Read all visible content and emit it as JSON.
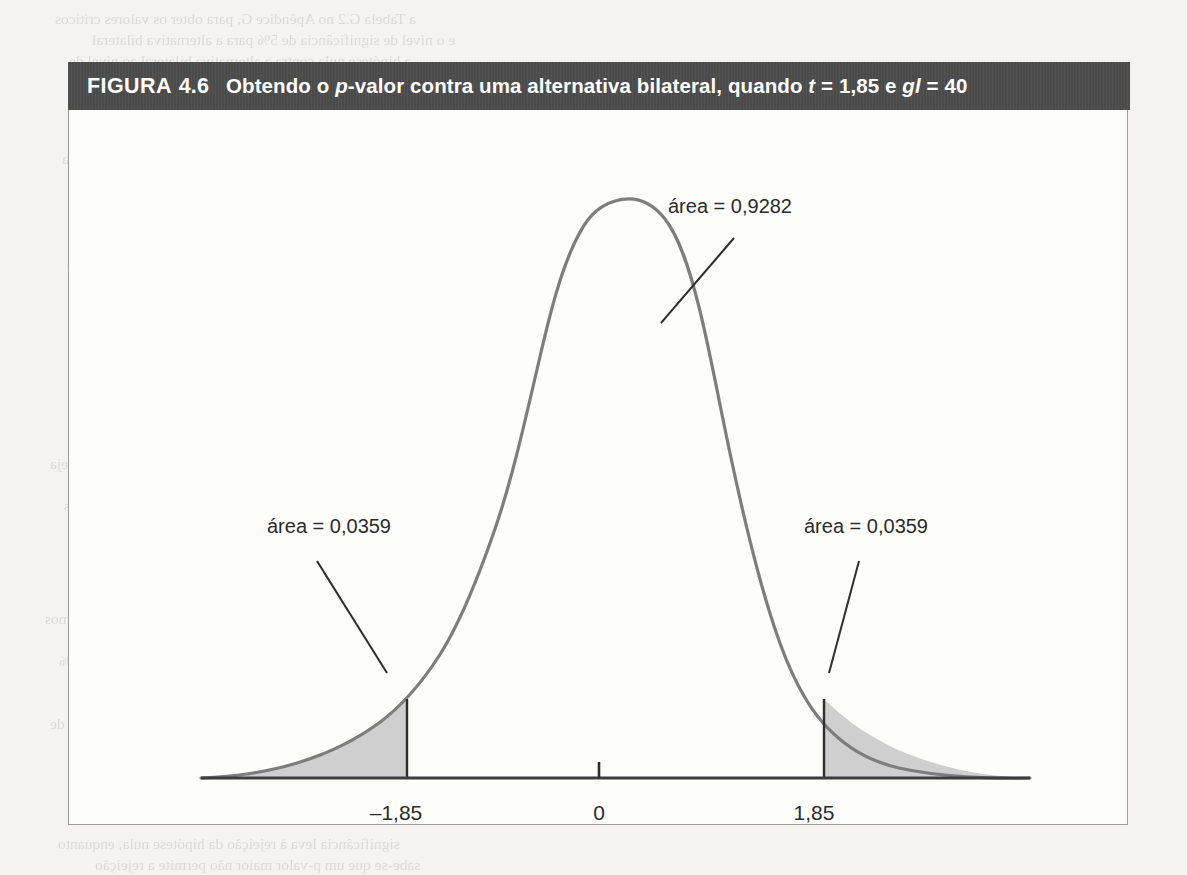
{
  "page": {
    "background_color": "#f4f3f1",
    "bleed_through_lines": [
      "a Tabela G.2 no Apêndice G, para obter os valores críticos",
      "e o nível de significância de 5% para a alternativa bilateral",
      "a hipótese nula contra a alternativa bilateral ao nível de",
      "significância de 5%, uma vez que o valor crítico é 2,021",
      "e o valor absoluto da estatística t é 1,85, menor que",
      "o valor crítico, não podemos rejeitar a hipótese nula",
      "a regra de rejeição para a alternativa bilateral",
      "portanto, concluímos que a variável não é estatisticamente",
      "significante ao nível de 5% contra a alternativa bilateral",
      "Para obter o p-valor, devemos calcular a probabilidade",
      "de observar um valor da estatística t tão extremo quanto",
      "o valor observado, supondo que a hipótese nula seja",
      "verdadeira. Sob a hipótese nula, a estatística t possui uma",
      "distribuição t com 40 graus de liberdade, e a área nas",
      "duas caudas além de 1,85 em valor absoluto é igual a",
      "0,0359 + 0,0359 = 0,0718, que é o p-valor do teste",
      "bilateral. Como o p-valor é maior que 0,05, não podemos",
      "rejeitar a hipótese nula ao nível de significância de 5%",
      "mas poderíamos rejeitá-la ao nível de significância de 10%",
      "uma vez que o p-valor de 0,0718 é menor que 0,10",
      "Este exemplo ilustra a relação entre o p-valor e os",
      "valores críticos: um p-valor menor que o nível de",
      "significância leva à rejeição da hipótese nula, enquanto",
      "sabe-se que um p-valor maior não permite a rejeição",
      "o gráfico a seguir mostra graficamente este resultado",
      "onde as áreas sombreadas representam as caudas",
      "e a área central corresponde a 0,9282 da distribuição"
    ]
  },
  "figure": {
    "header": {
      "label": "FIGURA",
      "number": "4.6",
      "caption_parts": [
        {
          "text": "Obtendo o ",
          "italic": false
        },
        {
          "text": "p",
          "italic": true
        },
        {
          "text": "-valor contra uma alternativa bilateral, quando ",
          "italic": false
        },
        {
          "text": "t",
          "italic": true
        },
        {
          "text": " = 1,85 e ",
          "italic": false
        },
        {
          "text": "gl",
          "italic": true
        },
        {
          "text": " = 40",
          "italic": false
        }
      ],
      "caption_plain": "Obtendo o p-valor contra uma alternativa bilateral, quando t = 1,85 e gl = 40",
      "background_color": "#4d4d4d",
      "text_color": "#ffffff"
    },
    "frame": {
      "border_color": "#9a9a9a",
      "background_color": "#fdfdfc"
    }
  },
  "annotations": {
    "center_area": "área = 0,9282",
    "left_tail_area": "área = 0,0359",
    "right_tail_area": "área = 0,0359"
  },
  "axis": {
    "tick_labels": [
      "–1,85",
      "0",
      "1,85"
    ],
    "line_color": "#3c3c3c"
  },
  "chart_data": {
    "type": "area",
    "title": "Obtendo o p-valor contra uma alternativa bilateral, quando t = 1,85 e gl = 40",
    "distribution": "t de Student",
    "degrees_of_freedom": 40,
    "xlabel": "",
    "ylabel": "",
    "xlim": [
      -4.2,
      4.2
    ],
    "ylim": [
      0,
      0.42
    ],
    "grid": false,
    "legend": "none",
    "x_ticks": [
      -1.85,
      0,
      1.85
    ],
    "x_tick_labels": [
      "–1,85",
      "0",
      "1,85"
    ],
    "critical_value": 1.85,
    "curve_color": "#7d7d7d",
    "shaded_fill_color": "#cfcfcf",
    "regions": [
      {
        "name": "left_tail",
        "from": -4.2,
        "to": -1.85,
        "area": 0.0359,
        "label": "área = 0,0359",
        "shaded": true
      },
      {
        "name": "center",
        "from": -1.85,
        "to": 1.85,
        "area": 0.9282,
        "label": "área = 0,9282",
        "shaded": false
      },
      {
        "name": "right_tail",
        "from": 1.85,
        "to": 4.2,
        "area": 0.0359,
        "label": "área = 0,0359",
        "shaded": true
      }
    ],
    "p_value": 0.0718,
    "series": [
      {
        "name": "densidade t(40)",
        "x": [
          -4.2,
          -4.0,
          -3.8,
          -3.6,
          -3.4,
          -3.2,
          -3.0,
          -2.8,
          -2.6,
          -2.4,
          -2.2,
          -2.0,
          -1.85,
          -1.8,
          -1.6,
          -1.4,
          -1.2,
          -1.0,
          -0.8,
          -0.6,
          -0.4,
          -0.2,
          0.0,
          0.2,
          0.4,
          0.6,
          0.8,
          1.0,
          1.2,
          1.4,
          1.6,
          1.8,
          1.85,
          2.0,
          2.2,
          2.4,
          2.6,
          2.8,
          3.0,
          3.2,
          3.4,
          3.6,
          3.8,
          4.0,
          4.2
        ],
        "y": [
          0.0007,
          0.0011,
          0.0016,
          0.0024,
          0.0036,
          0.0054,
          0.0079,
          0.0115,
          0.0166,
          0.0237,
          0.0334,
          0.0463,
          0.0583,
          0.063,
          0.0838,
          0.1085,
          0.1365,
          0.1667,
          0.1976,
          0.2272,
          0.2535,
          0.2743,
          0.288,
          0.2743,
          0.2535,
          0.2272,
          0.1976,
          0.1667,
          0.1365,
          0.1085,
          0.0838,
          0.063,
          0.0583,
          0.0463,
          0.0334,
          0.0237,
          0.0166,
          0.0115,
          0.0079,
          0.0054,
          0.0036,
          0.0024,
          0.0016,
          0.0011,
          0.0007
        ]
      }
    ]
  }
}
